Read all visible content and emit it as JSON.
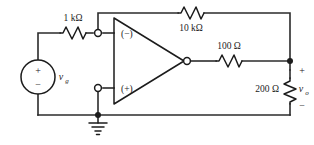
{
  "figure": {
    "kind": "circuit-schematic",
    "background_color": "#ffffff",
    "line_color": "#2b2b2b"
  },
  "components": {
    "source": {
      "name": "independent-voltage-source",
      "label": "v",
      "label_subscript": "g",
      "plus_sign": "+",
      "minus_sign": "−"
    },
    "input_resistor": {
      "name": "input-resistor",
      "label": "1 kΩ"
    },
    "feedback_resistor": {
      "name": "feedback-resistor",
      "label": "10 kΩ"
    },
    "series_resistor": {
      "name": "series-output-resistor",
      "label": "100 Ω"
    },
    "load_resistor": {
      "name": "load-resistor",
      "label": "200 Ω"
    },
    "opamp": {
      "name": "operational-amplifier",
      "inverting_label": "(−)",
      "noninverting_label": "(+)"
    },
    "output": {
      "name": "output-voltage",
      "label": "v",
      "label_subscript": "o",
      "plus_sign": "+",
      "minus_sign": "−"
    },
    "ground": {
      "name": "ground-symbol",
      "label": ""
    }
  }
}
